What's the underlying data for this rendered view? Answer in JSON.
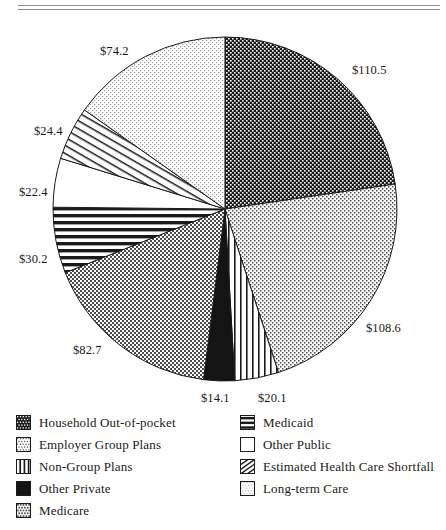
{
  "chart_data": {
    "type": "pie",
    "title": "",
    "units": "billions of dollars",
    "total": 487.2,
    "start_angle_deg": 0,
    "direction": "clockwise",
    "labels": [
      "Household Out-of-pocket",
      "Employer Group Plans",
      "Non-Group Plans",
      "Other Private",
      "Medicare",
      "Medicaid",
      "Other Public",
      "Estimated Health Care Shortfall",
      "Long-term Care"
    ],
    "values": [
      110.5,
      108.6,
      20.1,
      14.1,
      82.7,
      30.2,
      22.4,
      24.4,
      74.2
    ],
    "data_labels": [
      "$110.5",
      "$108.6",
      "$20.1",
      "$14.1",
      "$82.7",
      "$30.2",
      "$22.4",
      "$24.4",
      "$74.2"
    ],
    "patterns": [
      "dark-checker",
      "light-dots",
      "vertical-lines",
      "solid-black",
      "medium-checker",
      "horizontal-lines",
      "blank-white",
      "diagonal-lines",
      "faint-dots"
    ],
    "legend_position": "bottom",
    "grid": false
  },
  "pie": {
    "callouts": [
      {
        "text": "$110.5",
        "x": 352,
        "y": 45
      },
      {
        "text": "$108.6",
        "x": 366,
        "y": 303
      },
      {
        "text": "$20.1",
        "x": 258,
        "y": 373
      },
      {
        "text": "$14.1",
        "x": 201,
        "y": 373
      },
      {
        "text": "$82.7",
        "x": 73,
        "y": 325
      },
      {
        "text": "$30.2",
        "x": 19,
        "y": 234
      },
      {
        "text": "$22.4",
        "x": 19,
        "y": 167
      },
      {
        "text": "$24.4",
        "x": 34,
        "y": 106
      },
      {
        "text": "$74.2",
        "x": 100,
        "y": 26
      }
    ]
  },
  "legend": {
    "left_column": [
      {
        "label": "Household Out-of-pocket",
        "pattern": "dark-checker"
      },
      {
        "label": "Employer Group Plans",
        "pattern": "light-dots"
      },
      {
        "label": "Non-Group Plans",
        "pattern": "vertical-lines"
      },
      {
        "label": "Other Private",
        "pattern": "solid-black"
      },
      {
        "label": "Medicare",
        "pattern": "medium-checker"
      }
    ],
    "right_column": [
      {
        "label": "Medicaid",
        "pattern": "horizontal-lines"
      },
      {
        "label": "Other Public",
        "pattern": "blank-white"
      },
      {
        "label": "Estimated Health Care Shortfall",
        "pattern": "diagonal-lines"
      },
      {
        "label": "Long-term Care",
        "pattern": "faint-dots"
      }
    ]
  }
}
